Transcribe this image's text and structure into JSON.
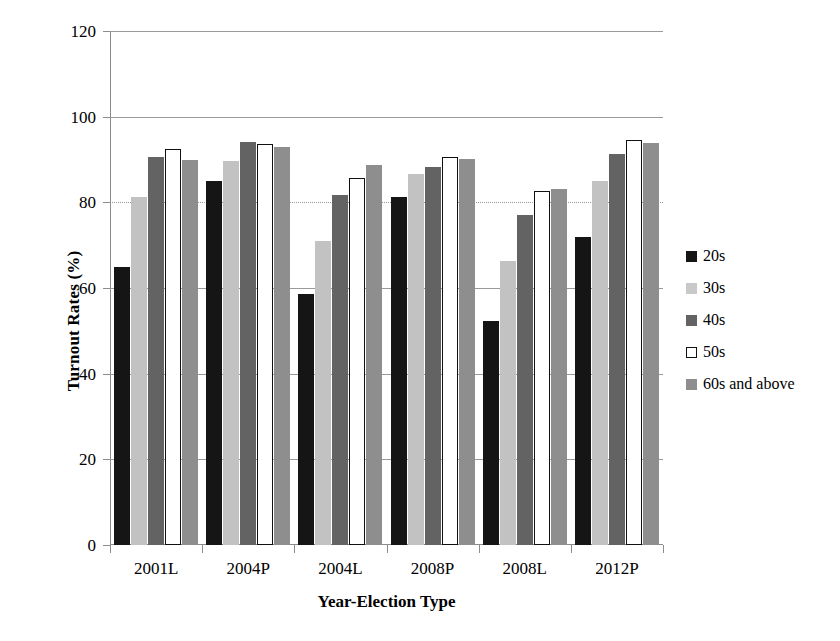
{
  "chart_data": {
    "type": "bar",
    "title": "",
    "xlabel": "Year-Election Type",
    "ylabel": "Turnout Rates (%)",
    "categories": [
      "2001L",
      "2004P",
      "2004L",
      "2008P",
      "2008L",
      "2012P"
    ],
    "ylim": [
      0,
      120
    ],
    "yticks": [
      0,
      20,
      40,
      60,
      80,
      100,
      120
    ],
    "grid": true,
    "legend_position": "right",
    "series": [
      {
        "name": "20s",
        "color": "#151515",
        "values": [
          65.0,
          85.0,
          58.5,
          81.3,
          52.3,
          71.8
        ]
      },
      {
        "name": "30s",
        "color": "#c2c2c2",
        "values": [
          81.2,
          89.6,
          71.0,
          86.6,
          66.4,
          85.0
        ]
      },
      {
        "name": "40s",
        "color": "#636363",
        "values": [
          90.6,
          94.0,
          81.7,
          88.3,
          77.1,
          91.4
        ]
      },
      {
        "name": "50s",
        "color": "#ffffff",
        "values": [
          92.5,
          93.6,
          85.8,
          90.5,
          82.7,
          94.5
        ]
      },
      {
        "name": "60s and above",
        "color": "#8e8e8e",
        "values": [
          89.8,
          92.9,
          88.8,
          90.2,
          83.1,
          93.9
        ]
      }
    ]
  },
  "legend": {
    "items": [
      {
        "label": "20s"
      },
      {
        "label": "30s"
      },
      {
        "label": "40s"
      },
      {
        "label": "50s"
      },
      {
        "label": "60s and above"
      }
    ]
  },
  "axes": {
    "y_title": "Turnout Rates (%)",
    "x_title": "Year-Election Type",
    "y_tick_labels": [
      "120",
      "100",
      "80",
      "60",
      "40",
      "20",
      "0"
    ],
    "x_tick_labels": [
      "2001L",
      "2004P",
      "2004L",
      "2008P",
      "2008L",
      "2012P"
    ]
  }
}
